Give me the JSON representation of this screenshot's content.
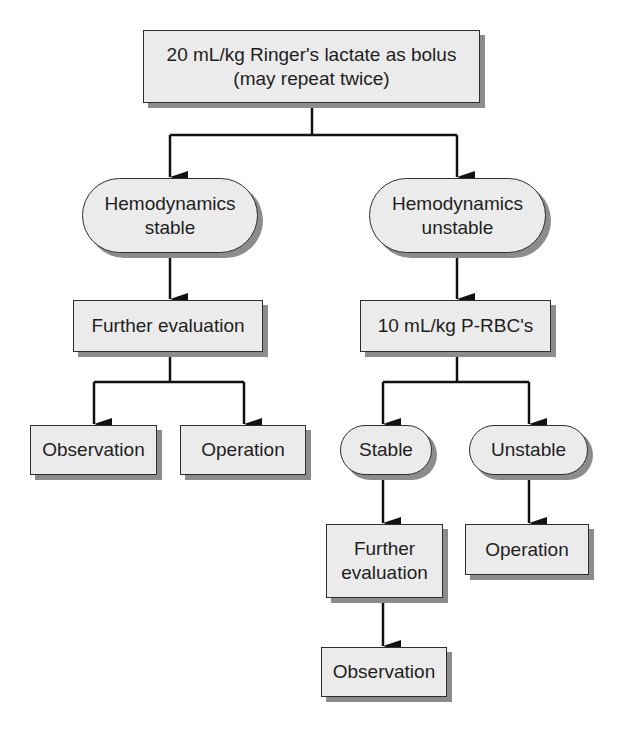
{
  "diagram": {
    "type": "flowchart",
    "colors": {
      "node_fill": "#ebebeb",
      "node_border": "#2e2e2e",
      "node_shadow": "#8c8c8c",
      "connector": "#111111",
      "text": "#1e1e1e"
    },
    "nodes": {
      "start": {
        "shape": "rectangle",
        "label": "20 mL/kg Ringer's lactate as bolus\n(may repeat twice)"
      },
      "hemo_stable": {
        "shape": "rounded",
        "label": "Hemodynamics\nstable"
      },
      "hemo_unstable": {
        "shape": "rounded",
        "label": "Hemodynamics\nunstable"
      },
      "further_eval_left": {
        "shape": "rectangle",
        "label": "Further evaluation"
      },
      "prbc": {
        "shape": "rectangle",
        "label": "10 mL/kg P-RBC's"
      },
      "observation_left": {
        "shape": "rectangle",
        "label": "Observation"
      },
      "operation_left": {
        "shape": "rectangle",
        "label": "Operation"
      },
      "stable": {
        "shape": "rounded",
        "label": "Stable"
      },
      "unstable": {
        "shape": "rounded",
        "label": "Unstable"
      },
      "further_eval_right": {
        "shape": "rectangle",
        "label": "Further\nevaluation"
      },
      "operation_right": {
        "shape": "rectangle",
        "label": "Operation"
      },
      "observation_right": {
        "shape": "rectangle",
        "label": "Observation"
      }
    },
    "edges": [
      {
        "from": "start",
        "to": "hemo_stable"
      },
      {
        "from": "start",
        "to": "hemo_unstable"
      },
      {
        "from": "hemo_stable",
        "to": "further_eval_left"
      },
      {
        "from": "further_eval_left",
        "to": "observation_left"
      },
      {
        "from": "further_eval_left",
        "to": "operation_left"
      },
      {
        "from": "hemo_unstable",
        "to": "prbc"
      },
      {
        "from": "prbc",
        "to": "stable"
      },
      {
        "from": "prbc",
        "to": "unstable"
      },
      {
        "from": "stable",
        "to": "further_eval_right"
      },
      {
        "from": "further_eval_right",
        "to": "observation_right"
      },
      {
        "from": "unstable",
        "to": "operation_right"
      }
    ]
  }
}
